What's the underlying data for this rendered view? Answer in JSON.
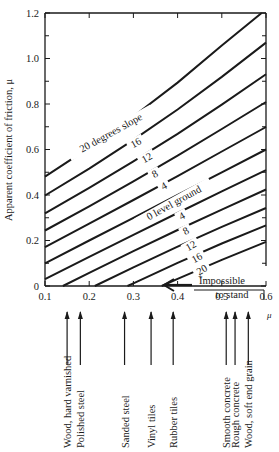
{
  "chart_data": {
    "type": "line",
    "title": "",
    "xlabel": "μ",
    "ylabel": "Apparent coefficient of friction, μ",
    "xlim": [
      0.1,
      0.6
    ],
    "ylim": [
      0,
      1.2
    ],
    "x_ticks": [
      "0.1",
      "0.2",
      "0.3",
      "0.4",
      "0.5",
      "0.6"
    ],
    "y_ticks": [
      "0",
      "0.2",
      "0.4",
      "0.6",
      "0.8",
      "1.0",
      "1.2"
    ],
    "grid": false,
    "legend": "inline labels",
    "x": [
      0.1,
      0.2,
      0.3,
      0.4,
      0.5,
      0.6
    ],
    "series": [
      {
        "name": "20 degrees slope",
        "direction": "uphill",
        "label": "20 degrees slope",
        "points": [
          [
            0.1,
            0.481
          ],
          [
            0.2,
            0.608
          ],
          [
            0.3,
            0.745
          ],
          [
            0.4,
            0.894
          ],
          [
            0.5,
            1.057
          ],
          [
            0.59,
            1.2
          ]
        ]
      },
      {
        "name": "16 uphill",
        "direction": "uphill",
        "label": "16",
        "points": [
          [
            0.1,
            0.398
          ],
          [
            0.2,
            0.516
          ],
          [
            0.3,
            0.642
          ],
          [
            0.4,
            0.776
          ],
          [
            0.5,
            0.919
          ],
          [
            0.6,
            1.07
          ]
        ]
      },
      {
        "name": "12 uphill",
        "direction": "uphill",
        "label": "12",
        "points": [
          [
            0.1,
            0.319
          ],
          [
            0.2,
            0.431
          ],
          [
            0.3,
            0.548
          ],
          [
            0.4,
            0.669
          ],
          [
            0.5,
            0.797
          ],
          [
            0.6,
            0.931
          ]
        ]
      },
      {
        "name": "8 uphill",
        "direction": "uphill",
        "label": "8",
        "points": [
          [
            0.1,
            0.244
          ],
          [
            0.2,
            0.35
          ],
          [
            0.3,
            0.46
          ],
          [
            0.4,
            0.573
          ],
          [
            0.5,
            0.69
          ],
          [
            0.6,
            0.809
          ]
        ]
      },
      {
        "name": "4 uphill",
        "direction": "uphill",
        "label": "4",
        "points": [
          [
            0.1,
            0.171
          ],
          [
            0.2,
            0.274
          ],
          [
            0.3,
            0.378
          ],
          [
            0.4,
            0.483
          ],
          [
            0.5,
            0.591
          ],
          [
            0.6,
            0.699
          ]
        ]
      },
      {
        "name": "0 level ground",
        "direction": "level",
        "label": "0 level ground",
        "points": [
          [
            0.1,
            0.1
          ],
          [
            0.2,
            0.2
          ],
          [
            0.3,
            0.3
          ],
          [
            0.4,
            0.4
          ],
          [
            0.5,
            0.5
          ],
          [
            0.6,
            0.6
          ]
        ]
      },
      {
        "name": "4 downhill",
        "direction": "downhill",
        "label": "4",
        "points": [
          [
            0.1,
            0.03
          ],
          [
            0.2,
            0.128
          ],
          [
            0.3,
            0.225
          ],
          [
            0.4,
            0.321
          ],
          [
            0.5,
            0.416
          ],
          [
            0.6,
            0.509
          ]
        ]
      },
      {
        "name": "8 downhill",
        "direction": "downhill",
        "label": "8",
        "points": [
          [
            0.1405,
            0
          ],
          [
            0.2,
            0.058
          ],
          [
            0.3,
            0.153
          ],
          [
            0.4,
            0.246
          ],
          [
            0.5,
            0.336
          ],
          [
            0.6,
            0.424
          ]
        ]
      },
      {
        "name": "12 downhill",
        "direction": "downhill",
        "label": "12",
        "points": [
          [
            0.2126,
            0
          ],
          [
            0.3,
            0.082
          ],
          [
            0.4,
            0.173
          ],
          [
            0.5,
            0.26
          ],
          [
            0.6,
            0.343
          ]
        ]
      },
      {
        "name": "16 downhill",
        "direction": "downhill",
        "label": "16",
        "points": [
          [
            0.2867,
            0
          ],
          [
            0.3,
            0.012
          ],
          [
            0.4,
            0.102
          ],
          [
            0.5,
            0.187
          ],
          [
            0.6,
            0.267
          ]
        ]
      },
      {
        "name": "20 downhill",
        "direction": "downhill",
        "label": "20",
        "points": [
          [
            0.364,
            0
          ],
          [
            0.4,
            0.031
          ],
          [
            0.5,
            0.115
          ],
          [
            0.6,
            0.194
          ]
        ]
      }
    ],
    "annotations": [
      {
        "text": "Impossible",
        "x": 0.52,
        "y": 0.03
      },
      {
        "text": "to stand",
        "x": 0.55,
        "y": -0.02
      },
      {
        "text": "+",
        "x": 0.47,
        "y": 0.04
      }
    ],
    "materials": [
      {
        "label": "Wood, hard varnished",
        "mu": 0.15
      },
      {
        "label": "Polished steel",
        "mu": 0.18
      },
      {
        "label": "Sanded steel",
        "mu": 0.28
      },
      {
        "label": "Vinyl tiles",
        "mu": 0.34
      },
      {
        "label": "Rubber tiles",
        "mu": 0.39
      },
      {
        "label": "Smooth concrete",
        "mu": 0.51
      },
      {
        "label": "Rough concrete",
        "mu": 0.53
      },
      {
        "label": "Wood, soft end grain",
        "mu": 0.56
      }
    ]
  },
  "labels": {
    "ylabel": "Apparent coefficient of friction, μ",
    "xlabel": "μ",
    "impossible_1": "Impossible",
    "impossible_2": "to stand",
    "plus": "+"
  }
}
